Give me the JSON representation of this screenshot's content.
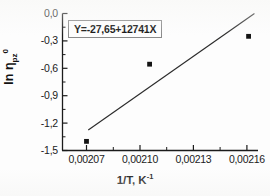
{
  "chart_data": {
    "type": "scatter",
    "title": "",
    "subtitle": "",
    "xlabel": "1/T, K",
    "xlabel_sup": "-1",
    "ylabel_prefix": "ln ",
    "ylabel_symbol": "η",
    "ylabel_sub": "pz",
    "ylabel_sup": "0",
    "x": [
      0.00207,
      0.0021055,
      0.0021612
    ],
    "values": [
      -1.4,
      -0.555,
      -0.25
    ],
    "series": [
      {
        "name": "data points",
        "x": [
          0.00207,
          0.0021055,
          0.0021612
        ],
        "values": [
          -1.4,
          -0.555,
          -0.25
        ],
        "marker": "square",
        "color": "#141414"
      },
      {
        "name": "linear fit",
        "type": "line",
        "x": [
          0.002071,
          0.0021645
        ],
        "values": [
          -1.276,
          0.0
        ],
        "color": "#2b2b2b"
      }
    ],
    "fit": {
      "intercept": -27.65,
      "slope": 12741,
      "equation": "Y=-27,65+12741X"
    },
    "xlim": [
      0.0020565,
      0.0021665
    ],
    "ylim": [
      -1.5,
      0.0
    ],
    "xticks": [
      0.00207,
      0.0021,
      0.00213,
      0.00216
    ],
    "xticklabels": [
      "0,00207",
      "0,00210",
      "0,00213",
      "0,00216"
    ],
    "yticks": [
      0.0,
      -0.3,
      -0.6,
      -0.9,
      -1.2,
      -1.5
    ],
    "yticklabels": [
      "0,0",
      "-0,3",
      "-0,6",
      "-0,9",
      "-1,2",
      "-1,5"
    ],
    "grid": false,
    "legend": "none",
    "minor_ticks": true,
    "annotation": "Y=-27,65+12741X"
  },
  "axes": {
    "y_tick_labels": [
      "0,0",
      "-0,3",
      "-0,6",
      "-0,9",
      "-1,2",
      "-1,5"
    ],
    "x_tick_labels": [
      "0,00207",
      "0,00210",
      "0,00213",
      "0,00216"
    ],
    "x_title_text": "1/T, K",
    "x_title_sup": "-1",
    "y_title_ln": "ln ",
    "y_title_eta": "η",
    "y_title_sub": "pz",
    "y_title_sup": "0"
  },
  "annotation": {
    "equation": "Y=-27,65+12741X"
  },
  "colors": {
    "axis": "#1b1b1b",
    "marker": "#141414",
    "fit_line": "#2b2b2b",
    "box_border": "#8a8a8a",
    "background": "#fdfdfd",
    "text": "#111111"
  }
}
